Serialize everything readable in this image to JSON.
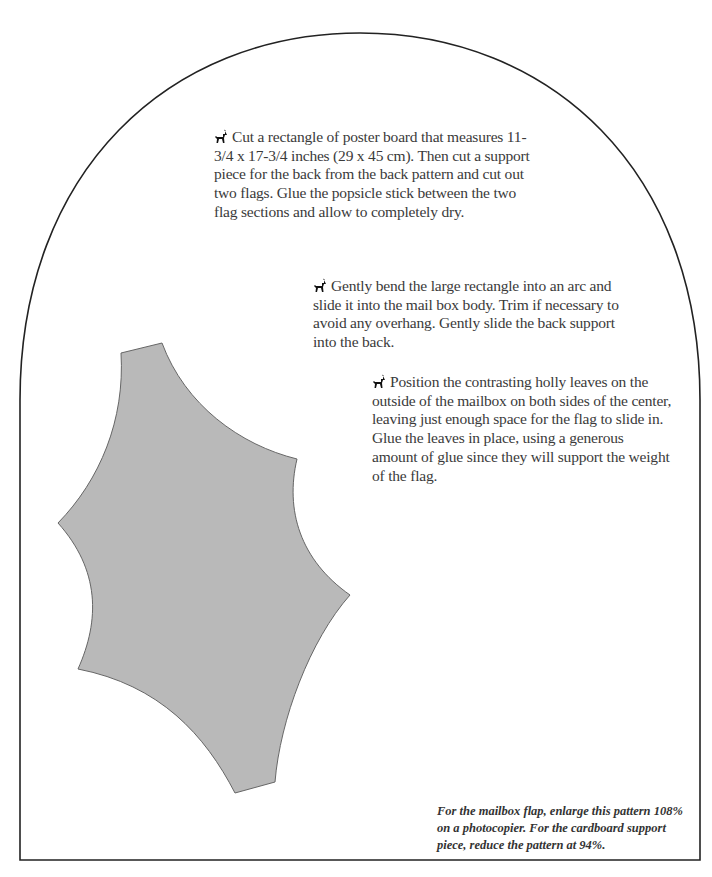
{
  "instructions": [
    {
      "icon": "deer-icon",
      "text": "Cut a rectangle of poster board that measures 11-3/4 x 17-3/4 inches (29 x 45 cm). Then cut a support piece for the back from the back pattern and cut out two flags. Glue the popsicle stick between the two flag sections and allow to completely dry."
    },
    {
      "icon": "deer-icon",
      "text": "Gently bend the large rectangle into an arc and slide it into the mail box body. Trim if necessary to avoid any overhang. Gently slide the back support into the back."
    },
    {
      "icon": "deer-icon",
      "text": "Position the contrasting holly leaves on the outside of the mailbox on both sides of the center, leaving just enough space for the flag to slide in. Glue the leaves in place, using a generous amount of glue since they will support the weight of the flag."
    }
  ],
  "pattern_note": "For the mailbox flap, enlarge this pattern 108% on a photocopier. For the cardboard support piece, reduce the pattern at 94%.",
  "colors": {
    "outline": "#222222",
    "holly_fill": "#b9b9b9",
    "holly_stroke": "#666666",
    "text": "#3a3a3a"
  }
}
